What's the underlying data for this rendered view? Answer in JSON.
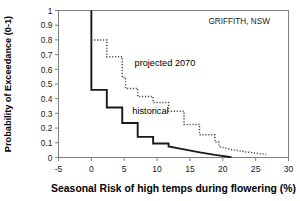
{
  "chart_data": {
    "type": "line",
    "title": "",
    "annotation_site": "GRIFFITH, NSW",
    "xlabel": "Seasonal Risk of high temps during flowering (%)",
    "ylabel": "Probability of Exceedance (0-1)",
    "xlim": [
      -5,
      30
    ],
    "ylim": [
      0,
      1
    ],
    "xticks": [
      -5,
      0,
      5,
      10,
      15,
      20,
      25,
      30
    ],
    "xtick_labels": [
      "-5",
      "0",
      "5",
      "10",
      "15",
      "20",
      "25",
      "30"
    ],
    "yticks": [
      0,
      0.1,
      0.2,
      0.3,
      0.4,
      0.5,
      0.6,
      0.7,
      0.8,
      0.9,
      1
    ],
    "ytick_labels": [
      "0",
      "0.1",
      "0.2",
      "0.3",
      "0.4",
      "0.5",
      "0.6",
      "0.7",
      "0.8",
      "0.9",
      "1"
    ],
    "grid": false,
    "legend_position": "inline-annotations",
    "series": [
      {
        "name": "historical",
        "style": "solid",
        "color": "#1a1a1a",
        "label_x": 9.0,
        "label_y": 0.295,
        "points": [
          [
            0.0,
            1.0
          ],
          [
            0.0,
            0.46
          ],
          [
            2.35,
            0.46
          ],
          [
            2.35,
            0.34
          ],
          [
            4.7,
            0.34
          ],
          [
            4.7,
            0.235
          ],
          [
            7.05,
            0.235
          ],
          [
            7.05,
            0.14
          ],
          [
            9.4,
            0.14
          ],
          [
            9.4,
            0.095
          ],
          [
            11.75,
            0.095
          ],
          [
            11.75,
            0.075
          ],
          [
            14.1,
            0.055
          ],
          [
            16.5,
            0.035
          ],
          [
            18.8,
            0.018
          ],
          [
            21.2,
            0.003
          ],
          [
            21.2,
            0.0
          ]
        ]
      },
      {
        "name": "projected 2070",
        "style": "dotted",
        "color": "#4a4a4a",
        "label_x": 11.2,
        "label_y": 0.625,
        "points": [
          [
            0.0,
            0.8
          ],
          [
            2.35,
            0.8
          ],
          [
            2.35,
            0.685
          ],
          [
            4.7,
            0.685
          ],
          [
            4.7,
            0.545
          ],
          [
            5.2,
            0.545
          ],
          [
            5.2,
            0.47
          ],
          [
            7.05,
            0.47
          ],
          [
            7.05,
            0.415
          ],
          [
            9.4,
            0.415
          ],
          [
            9.4,
            0.375
          ],
          [
            11.75,
            0.375
          ],
          [
            11.75,
            0.315
          ],
          [
            14.1,
            0.315
          ],
          [
            14.1,
            0.225
          ],
          [
            16.45,
            0.225
          ],
          [
            16.45,
            0.155
          ],
          [
            18.8,
            0.155
          ],
          [
            18.8,
            0.105
          ],
          [
            19.4,
            0.105
          ],
          [
            19.4,
            0.075
          ],
          [
            21.2,
            0.055
          ],
          [
            23.5,
            0.038
          ],
          [
            26.4,
            0.022
          ],
          [
            26.6,
            0.02
          ]
        ]
      }
    ]
  },
  "axes": {
    "frame_color": "#808080",
    "tick_color": "#808080"
  }
}
